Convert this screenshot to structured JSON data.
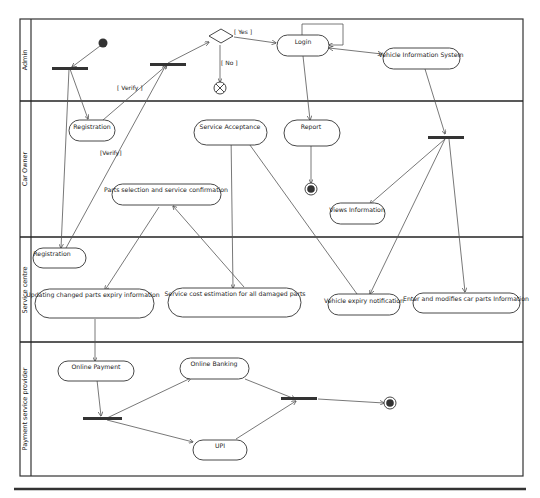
{
  "diagram": {
    "type": "UML activity diagram (swimlanes)",
    "lanes": [
      {
        "id": "admin",
        "label": "Admin"
      },
      {
        "id": "car_owner",
        "label": "Car Owner"
      },
      {
        "id": "service_centre",
        "label": "Service centre"
      },
      {
        "id": "payment",
        "label": "Payment service provider"
      }
    ],
    "nodes": {
      "login": "Login",
      "vehicle_info_system": "Vehicle Information System",
      "registration_owner": "Registration",
      "service_acceptance": "Service Acceptance",
      "report": "Report",
      "parts_selection": "Parts selection and service confirmation",
      "views_information": "Views Information",
      "registration_centre": "Registration",
      "updating_parts": "Updating changed parts expiry information",
      "cost_estimation": "Service cost estimation for all damaged parts",
      "expiry_notification": "Vehicle expiry notification",
      "enter_modify_parts": "Enter and modifies car parts Information",
      "online_payment": "Online Payment",
      "online_banking": "Online Banking",
      "upi": "UPI"
    },
    "guards": {
      "yes": "[ Yes ]",
      "no": "[ No ]",
      "verify1": "[ Verify ]",
      "verify2": "[Verify]"
    },
    "edges": [
      {
        "from": "initial",
        "to": "fork_admin_1"
      },
      {
        "from": "fork_admin_1",
        "to": "registration_owner"
      },
      {
        "from": "fork_admin_1",
        "to": "registration_centre"
      },
      {
        "from": "registration_owner",
        "to": "fork_admin_2",
        "guard": "verify1"
      },
      {
        "from": "registration_centre",
        "to": "fork_admin_2",
        "guard": "verify2"
      },
      {
        "from": "fork_admin_2",
        "to": "decision"
      },
      {
        "from": "decision",
        "to": "login",
        "guard": "yes"
      },
      {
        "from": "decision",
        "to": "flow_final",
        "guard": "no"
      },
      {
        "from": "login",
        "to": "login",
        "kind": "self-loop"
      },
      {
        "from": "login",
        "to": "vehicle_info_system",
        "kind": "bidirectional"
      },
      {
        "from": "login",
        "to": "report"
      },
      {
        "from": "report",
        "to": "final_owner"
      },
      {
        "from": "vehicle_info_system",
        "to": "fork_owner"
      },
      {
        "from": "fork_owner",
        "to": "views_information"
      },
      {
        "from": "fork_owner",
        "to": "expiry_notification"
      },
      {
        "from": "fork_owner",
        "to": "enter_modify_parts"
      },
      {
        "from": "expiry_notification",
        "to": "service_acceptance"
      },
      {
        "from": "service_acceptance",
        "to": "cost_estimation"
      },
      {
        "from": "cost_estimation",
        "to": "parts_selection"
      },
      {
        "from": "parts_selection",
        "to": "updating_parts"
      },
      {
        "from": "updating_parts",
        "to": "online_payment"
      },
      {
        "from": "online_payment",
        "to": "fork_payment"
      },
      {
        "from": "fork_payment",
        "to": "online_banking"
      },
      {
        "from": "fork_payment",
        "to": "upi"
      },
      {
        "from": "online_banking",
        "to": "join_payment"
      },
      {
        "from": "upi",
        "to": "join_payment"
      },
      {
        "from": "join_payment",
        "to": "final_payment"
      }
    ]
  }
}
